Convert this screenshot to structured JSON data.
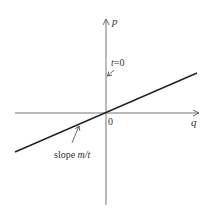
{
  "diagram": {
    "axes": {
      "x_label": "q",
      "y_label": "p",
      "origin_label": "0"
    },
    "annotations": {
      "t_label_prefix": "t",
      "t_label_suffix": "=0",
      "slope_prefix": "slope ",
      "slope_value": "m/t"
    },
    "colors": {
      "axis": "#555555",
      "line": "#222222",
      "text": "#333333"
    }
  }
}
